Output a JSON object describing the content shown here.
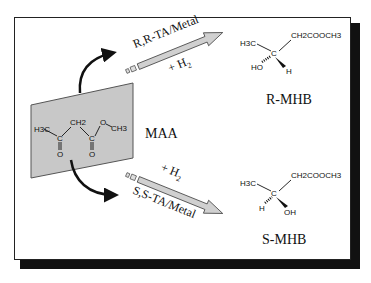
{
  "diagram": {
    "substrate": {
      "label": "MAA",
      "structure": {
        "h3c": "H3C",
        "ch2": "CH2",
        "o_ester": "O",
        "ch3": "CH3",
        "c1": "C",
        "c2": "C",
        "o1": "O",
        "o2": "O"
      }
    },
    "top_path": {
      "catalyst": "R,R-TA/Metal",
      "reagent": "+ H",
      "reagent_sub": "2"
    },
    "bottom_path": {
      "catalyst": "S,S-TA/Metal",
      "reagent": "+ H",
      "reagent_sub": "2"
    },
    "top_product": {
      "label": "R-MHB",
      "h3c": "H3C",
      "chain": "CH2COOCH3",
      "center": "C",
      "dash_group": "HO",
      "wedge_group": "H"
    },
    "bottom_product": {
      "label": "S-MHB",
      "h3c": "H3C",
      "chain": "CH2COOCH3",
      "center": "C",
      "dash_group": "H",
      "wedge_group": "OH"
    },
    "colors": {
      "panel": "#c8c8c8",
      "arrow_fill": "#d0d0d0",
      "frame_shadow": "#111111"
    }
  }
}
